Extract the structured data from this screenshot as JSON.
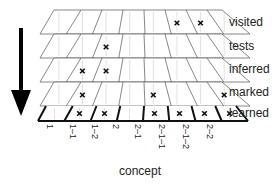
{
  "diagram": {
    "axis_label": "concept",
    "concepts": [
      "1",
      "1–1",
      "1–2",
      "2",
      "2–1",
      "2–1–1",
      "2–1–2",
      "2–2"
    ],
    "layers": [
      {
        "name": "visited",
        "marks": [
          5,
          6
        ]
      },
      {
        "name": "tests",
        "marks": [
          2
        ]
      },
      {
        "name": "inferred",
        "marks": [
          1,
          2
        ]
      },
      {
        "name": "marked",
        "marks": [
          1,
          4,
          7
        ]
      },
      {
        "name": "learned",
        "marks": [
          1,
          2,
          4,
          5,
          6,
          7
        ]
      }
    ],
    "arrow_direction": "down",
    "marker_glyph": "×",
    "colors": {
      "line": "#555555",
      "bold": "#111111",
      "mark": "#111111",
      "arrow": "#000000"
    }
  },
  "labels": {
    "layer_0": "visited",
    "layer_1": "tests",
    "layer_2": "inferred",
    "layer_3": "marked",
    "layer_4": "learned",
    "concept_0": "1",
    "concept_1": "1–1",
    "concept_2": "1–2",
    "concept_3": "2",
    "concept_4": "2–1",
    "concept_5": "2–1–1",
    "concept_6": "2–1–2",
    "concept_7": "2–2",
    "axis": "concept"
  }
}
